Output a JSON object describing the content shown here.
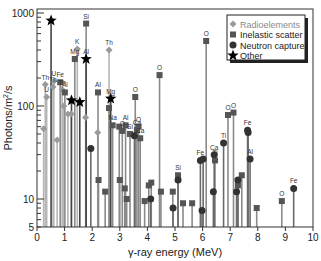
{
  "chart_data": {
    "type": "scatter",
    "subtype": "stem-log",
    "title": "",
    "xlabel": "γ-ray energy (MeV)",
    "ylabel": "Photons/m²/s",
    "xlim": [
      0,
      10
    ],
    "ylim": [
      5,
      1000
    ],
    "yscale": "log",
    "xticks": [
      "0",
      "1",
      "2",
      "3",
      "4",
      "5",
      "6",
      "7",
      "8",
      "9",
      "10"
    ],
    "yticks": [
      {
        "value": 5,
        "label": "5"
      },
      {
        "value": 10,
        "label": "10"
      },
      {
        "value": 100,
        "label": "100"
      },
      {
        "value": 1000,
        "label": "1000"
      }
    ],
    "grid": false,
    "legend_position": "upper right",
    "legend": [
      {
        "name": "Radioelements",
        "marker": "diamond",
        "color": "#9a9a9a"
      },
      {
        "name": "Inelastic scatter",
        "marker": "square",
        "color": "#555555"
      },
      {
        "name": "Neutron capture",
        "marker": "circle",
        "color": "#333333"
      },
      {
        "name": "Other",
        "marker": "star",
        "color": "#000000"
      }
    ],
    "series": [
      {
        "name": "Radioelements",
        "points": [
          {
            "x": 0.24,
            "y": 57,
            "label": ""
          },
          {
            "x": 0.3,
            "y": 170,
            "label": "Th"
          },
          {
            "x": 0.35,
            "y": 125,
            "label": "U"
          },
          {
            "x": 0.61,
            "y": 185,
            "label": "U"
          },
          {
            "x": 0.58,
            "y": 160,
            "label": "Th"
          },
          {
            "x": 0.73,
            "y": 43,
            "label": ""
          },
          {
            "x": 0.91,
            "y": 150,
            "label": "Th"
          },
          {
            "x": 0.97,
            "y": 100,
            "label": ""
          },
          {
            "x": 1.12,
            "y": 82,
            "label": ""
          },
          {
            "x": 1.24,
            "y": 82,
            "label": ""
          },
          {
            "x": 1.46,
            "y": 410,
            "label": "K"
          },
          {
            "x": 1.76,
            "y": 75,
            "label": ""
          },
          {
            "x": 2.2,
            "y": 52,
            "label": ""
          },
          {
            "x": 2.61,
            "y": 400,
            "label": "Th"
          }
        ]
      },
      {
        "name": "Inelastic scatter",
        "points": [
          {
            "x": 0.84,
            "y": 180,
            "label": "Fe"
          },
          {
            "x": 1.01,
            "y": 140,
            "label": "Al"
          },
          {
            "x": 1.37,
            "y": 320,
            "label": "Mg"
          },
          {
            "x": 1.78,
            "y": 770,
            "label": "Si"
          },
          {
            "x": 2.21,
            "y": 140,
            "label": "Al"
          },
          {
            "x": 2.23,
            "y": 16,
            "label": ""
          },
          {
            "x": 2.47,
            "y": 12,
            "label": ""
          },
          {
            "x": 2.61,
            "y": 95,
            "label": ""
          },
          {
            "x": 2.74,
            "y": 62,
            "label": "Na"
          },
          {
            "x": 2.98,
            "y": 60,
            "label": ""
          },
          {
            "x": 3.0,
            "y": 16,
            "label": ""
          },
          {
            "x": 3.09,
            "y": 54,
            "label": "O"
          },
          {
            "x": 3.18,
            "y": 13,
            "label": ""
          },
          {
            "x": 3.21,
            "y": 62,
            "label": "Al"
          },
          {
            "x": 3.25,
            "y": 10,
            "label": ""
          },
          {
            "x": 3.37,
            "y": 50,
            "label": "Si"
          },
          {
            "x": 3.56,
            "y": 125,
            "label": "O"
          },
          {
            "x": 3.62,
            "y": 55,
            "label": "Ca"
          },
          {
            "x": 3.68,
            "y": 60,
            "label": "O"
          },
          {
            "x": 3.74,
            "y": 45,
            "label": "Ca"
          },
          {
            "x": 3.9,
            "y": 9.5,
            "label": ""
          },
          {
            "x": 4.05,
            "y": 14,
            "label": ""
          },
          {
            "x": 4.14,
            "y": 15,
            "label": ""
          },
          {
            "x": 4.44,
            "y": 215,
            "label": "O"
          },
          {
            "x": 4.49,
            "y": 12,
            "label": ""
          },
          {
            "x": 4.92,
            "y": 12,
            "label": ""
          },
          {
            "x": 5.11,
            "y": 18,
            "label": "Si"
          },
          {
            "x": 5.29,
            "y": 9,
            "label": ""
          },
          {
            "x": 5.62,
            "y": 9,
            "label": ""
          },
          {
            "x": 6.13,
            "y": 500,
            "label": "O"
          },
          {
            "x": 6.45,
            "y": 26,
            "label": "Ti"
          },
          {
            "x": 6.92,
            "y": 80,
            "label": "O"
          },
          {
            "x": 7.12,
            "y": 85,
            "label": "O"
          },
          {
            "x": 7.28,
            "y": 14,
            "label": ""
          },
          {
            "x": 7.42,
            "y": 18,
            "label": ""
          },
          {
            "x": 7.96,
            "y": 8,
            "label": ""
          },
          {
            "x": 8.87,
            "y": 9.5,
            "label": "O"
          }
        ]
      },
      {
        "name": "Neutron capture",
        "points": [
          {
            "x": 1.95,
            "y": 35,
            "label": ""
          },
          {
            "x": 3.53,
            "y": 48,
            "label": ""
          },
          {
            "x": 4.12,
            "y": 10,
            "label": ""
          },
          {
            "x": 4.93,
            "y": 8,
            "label": ""
          },
          {
            "x": 5.11,
            "y": 16,
            "label": ""
          },
          {
            "x": 5.92,
            "y": 26,
            "label": "Fe"
          },
          {
            "x": 5.98,
            "y": 7.5,
            "label": ""
          },
          {
            "x": 6.02,
            "y": 27,
            "label": ""
          },
          {
            "x": 6.39,
            "y": 12,
            "label": ""
          },
          {
            "x": 6.42,
            "y": 30,
            "label": "Ca"
          },
          {
            "x": 6.76,
            "y": 40,
            "label": "Ti"
          },
          {
            "x": 7.23,
            "y": 12,
            "label": ""
          },
          {
            "x": 7.28,
            "y": 16,
            "label": ""
          },
          {
            "x": 7.63,
            "y": 55,
            "label": "Fe"
          },
          {
            "x": 7.65,
            "y": 52,
            "label": ""
          },
          {
            "x": 7.72,
            "y": 27,
            "label": "Al"
          },
          {
            "x": 9.3,
            "y": 13,
            "label": "Fe"
          }
        ]
      },
      {
        "name": "Other",
        "points": [
          {
            "x": 0.51,
            "y": 830,
            "label": ""
          },
          {
            "x": 1.25,
            "y": 115,
            "label": ""
          },
          {
            "x": 1.55,
            "y": 110,
            "label": ""
          },
          {
            "x": 1.78,
            "y": 320,
            "label": "Al"
          },
          {
            "x": 2.67,
            "y": 120,
            "label": "Mg"
          }
        ]
      }
    ]
  },
  "axes": {
    "xlabel": "γ-ray energy (MeV)",
    "ylabel_main": "Photons/m",
    "ylabel_sup": "2",
    "ylabel_tail": "/s"
  }
}
